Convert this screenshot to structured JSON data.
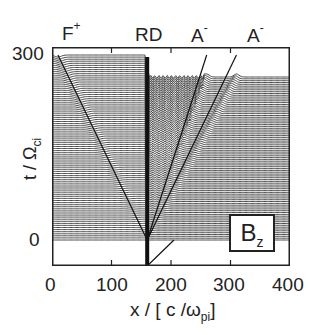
{
  "chart_data": {
    "type": "stacked-line",
    "title": "",
    "panel_label": {
      "main": "B",
      "sub": "z"
    },
    "xlabel": {
      "main": "x / [ c /ω",
      "sub": "pi",
      "end": "]"
    },
    "ylabel": {
      "main": "t / Ω",
      "sub": "ci"
    },
    "xlim": [
      0,
      400
    ],
    "ylim": [
      0,
      300
    ],
    "x_ticks": [
      "0",
      "100",
      "200",
      "300",
      "400"
    ],
    "y_ticks": [
      "0",
      "300"
    ],
    "top_annotations": [
      {
        "label": "F",
        "sup": "+",
        "x": 30
      },
      {
        "label": "RD",
        "sup": "",
        "x": 160
      },
      {
        "label": "A",
        "sup": "-",
        "x": 250
      },
      {
        "label": "A",
        "sup": "-",
        "x": 345
      }
    ],
    "features": {
      "rotational_discontinuity_x": 160,
      "stack_lines": 90,
      "left_plateau_level": "high",
      "right_plateau_level": "lower",
      "characteristics": [
        {
          "from_x": 160,
          "slope": "positive",
          "name": "A- fast"
        },
        {
          "from_x": 160,
          "slope": "positive",
          "name": "A- slow"
        },
        {
          "from_x": 160,
          "slope": "negative",
          "name": "F+"
        }
      ]
    },
    "grid": false,
    "legend_position": "lower-right"
  },
  "axes": {
    "x_ticks": [
      "0",
      "100",
      "200",
      "300",
      "400"
    ],
    "y_ticks": [
      "0",
      "300"
    ]
  }
}
